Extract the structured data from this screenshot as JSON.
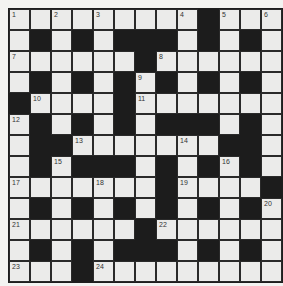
{
  "puzzle": {
    "rows": 13,
    "cols": 13,
    "colors": {
      "background": "#f3f3f1",
      "white_cell": "#ebebea",
      "black_cell": "#1c1c1c",
      "grid_line": "#2a2a2a",
      "number": "#333333"
    },
    "layout": [
      "WWWWWWWWWBWWW",
      "WBWBWBBBWBWBW",
      "WWWWWWBWWWWWW",
      "WBWBWBWBWBWBW",
      "BWWWWBWWWWWWW",
      "WBWBWBWBBBWBW",
      "WBBWWWWWWWBBW",
      "WBWBBBWBWBWBW",
      "WWWWWWWBWWWWB",
      "WBWBWBWBWBWBW",
      "WWWWWWBWWWWWW",
      "WBWBWBBBWBWBW",
      "WWWBWWWWWWWWW"
    ],
    "numbers": [
      {
        "row": 0,
        "col": 0,
        "n": "1"
      },
      {
        "row": 0,
        "col": 2,
        "n": "2"
      },
      {
        "row": 0,
        "col": 4,
        "n": "3"
      },
      {
        "row": 0,
        "col": 8,
        "n": "4"
      },
      {
        "row": 0,
        "col": 10,
        "n": "5"
      },
      {
        "row": 0,
        "col": 12,
        "n": "6"
      },
      {
        "row": 2,
        "col": 0,
        "n": "7"
      },
      {
        "row": 2,
        "col": 7,
        "n": "8"
      },
      {
        "row": 3,
        "col": 6,
        "n": "9"
      },
      {
        "row": 4,
        "col": 1,
        "n": "10"
      },
      {
        "row": 4,
        "col": 6,
        "n": "11"
      },
      {
        "row": 5,
        "col": 0,
        "n": "12"
      },
      {
        "row": 6,
        "col": 3,
        "n": "13"
      },
      {
        "row": 6,
        "col": 8,
        "n": "14"
      },
      {
        "row": 7,
        "col": 2,
        "n": "15"
      },
      {
        "row": 7,
        "col": 10,
        "n": "16"
      },
      {
        "row": 8,
        "col": 0,
        "n": "17"
      },
      {
        "row": 8,
        "col": 4,
        "n": "18"
      },
      {
        "row": 8,
        "col": 8,
        "n": "19"
      },
      {
        "row": 9,
        "col": 12,
        "n": "20"
      },
      {
        "row": 10,
        "col": 0,
        "n": "21"
      },
      {
        "row": 10,
        "col": 7,
        "n": "22"
      },
      {
        "row": 12,
        "col": 0,
        "n": "23"
      },
      {
        "row": 12,
        "col": 4,
        "n": "24"
      }
    ],
    "entries": []
  }
}
